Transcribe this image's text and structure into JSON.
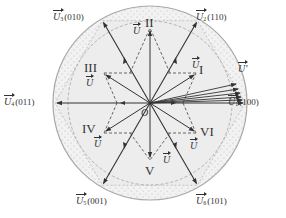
{
  "diagram": {
    "type": "space-vector-hexagon",
    "center_label": "O",
    "colors": {
      "line": "#333333",
      "dashed": "#666666",
      "outer_circle": "#aaaaaa",
      "fill_inner": "#eeeeee",
      "fill_band": "#f4f4f4"
    },
    "basic_vectors": [
      {
        "name": "U",
        "sub": "1",
        "code": "(100)",
        "angle_deg": 0
      },
      {
        "name": "U",
        "sub": "2",
        "code": "(110)",
        "angle_deg": 60
      },
      {
        "name": "U",
        "sub": "3",
        "code": "(010)",
        "angle_deg": 120
      },
      {
        "name": "U",
        "sub": "4",
        "code": "(011)",
        "angle_deg": 180
      },
      {
        "name": "U",
        "sub": "5",
        "code": "(001)",
        "angle_deg": 240
      },
      {
        "name": "U",
        "sub": "6",
        "code": "(101)",
        "angle_deg": 300
      }
    ],
    "sectors": [
      {
        "roman": "I",
        "vector_label": "U"
      },
      {
        "roman": "II",
        "vector_label": "U"
      },
      {
        "roman": "III",
        "vector_label": "U"
      },
      {
        "roman": "IV",
        "vector_label": "U"
      },
      {
        "roman": "V",
        "vector_label": "U"
      },
      {
        "roman": "VI",
        "vector_label": "U"
      }
    ],
    "overmod_label": "U'"
  }
}
